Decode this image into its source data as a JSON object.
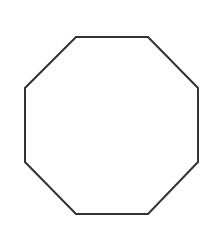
{
  "diagram": {
    "shape": "octagon",
    "stroke_color": "#333333",
    "fill_color": "#ffffff",
    "stroke_width": 2,
    "vertices": [
      [
        76,
        37
      ],
      [
        148,
        37
      ],
      [
        198,
        88
      ],
      [
        198,
        162
      ],
      [
        148,
        214
      ],
      [
        76,
        214
      ],
      [
        25,
        162
      ],
      [
        25,
        88
      ]
    ]
  }
}
